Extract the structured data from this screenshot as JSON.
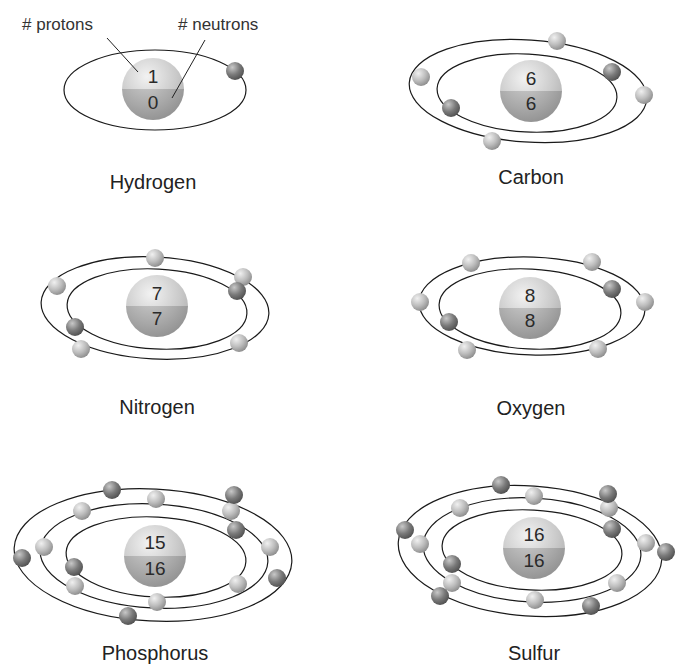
{
  "callouts": {
    "protons": "# protons",
    "neutrons": "# neutrons"
  },
  "atoms": [
    {
      "name": "Hydrogen",
      "protons": "1",
      "neutrons": "0",
      "electrons": 1,
      "shells": [
        1
      ]
    },
    {
      "name": "Carbon",
      "protons": "6",
      "neutrons": "6",
      "electrons": 6,
      "shells": [
        2,
        4
      ]
    },
    {
      "name": "Nitrogen",
      "protons": "7",
      "neutrons": "7",
      "electrons": 7,
      "shells": [
        2,
        5
      ]
    },
    {
      "name": "Oxygen",
      "protons": "8",
      "neutrons": "8",
      "electrons": 8,
      "shells": [
        2,
        6
      ]
    },
    {
      "name": "Phosphorus",
      "protons": "15",
      "neutrons": "16",
      "electrons": 15,
      "shells": [
        2,
        8,
        5
      ]
    },
    {
      "name": "Sulfur",
      "protons": "16",
      "neutrons": "16",
      "electrons": 16,
      "shells": [
        2,
        8,
        6
      ]
    }
  ],
  "colors": {
    "nucleus_light": "#d8d8d8",
    "nucleus_dark": "#9a9a9a",
    "electron_light": "#c4c4c4",
    "electron_dark": "#6e6e6e",
    "orbit": "#1a1a1a"
  }
}
